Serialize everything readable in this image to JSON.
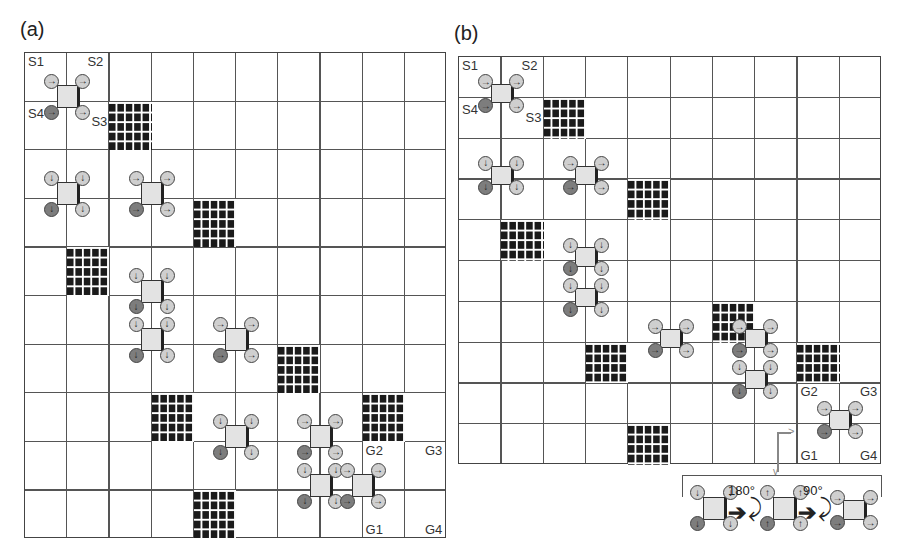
{
  "figure": {
    "panels": [
      {
        "id": "a",
        "label": "(a)",
        "grid": {
          "cols": 10,
          "rows": 10,
          "x": 24,
          "y": 52,
          "cell_w": 42.2,
          "cell_h": 48.6
        },
        "corner_labels": [
          {
            "text": "S1",
            "col": 0,
            "row": 0,
            "pos": "tl"
          },
          {
            "text": "S2",
            "col": 1,
            "row": 0,
            "pos": "tr"
          },
          {
            "text": "S4",
            "col": 0,
            "row": 1,
            "pos": "l"
          },
          {
            "text": "S3",
            "col": 1,
            "row": 1,
            "pos": "r"
          },
          {
            "text": "G2",
            "col": 8,
            "row": 8,
            "pos": "tl"
          },
          {
            "text": "G3",
            "col": 9,
            "row": 8,
            "pos": "tr"
          },
          {
            "text": "G1",
            "col": 8,
            "row": 9,
            "pos": "bl"
          },
          {
            "text": "G4",
            "col": 9,
            "row": 9,
            "pos": "br"
          }
        ],
        "obstacles": [
          [
            2,
            1
          ],
          [
            4,
            3
          ],
          [
            1,
            4
          ],
          [
            6,
            6
          ],
          [
            3,
            7
          ],
          [
            8,
            7
          ],
          [
            4,
            9
          ]
        ],
        "robots": [
          {
            "col": 1,
            "row": 1,
            "dir": "→"
          },
          {
            "col": 1,
            "row": 3,
            "dir": "↓"
          },
          {
            "col": 3,
            "row": 3,
            "dir": "→"
          },
          {
            "col": 3,
            "row": 5,
            "dir": "↓"
          },
          {
            "col": 3,
            "row": 6,
            "dir": "↓"
          },
          {
            "col": 5,
            "row": 6,
            "dir": "→"
          },
          {
            "col": 5,
            "row": 8,
            "dir": "↓"
          },
          {
            "col": 7,
            "row": 8,
            "dir": "→"
          },
          {
            "col": 7,
            "row": 9,
            "dir": "↓"
          },
          {
            "col": 8,
            "row": 9,
            "dir": "→"
          }
        ]
      },
      {
        "id": "b",
        "label": "(b)",
        "grid": {
          "cols": 10,
          "rows": 10,
          "x": 458,
          "y": 56,
          "cell_w": 42.3,
          "cell_h": 40.8
        },
        "corner_labels": [
          {
            "text": "S1",
            "col": 0,
            "row": 0,
            "pos": "tl"
          },
          {
            "text": "S2",
            "col": 1,
            "row": 0,
            "pos": "tr"
          },
          {
            "text": "S4",
            "col": 0,
            "row": 1,
            "pos": "l"
          },
          {
            "text": "S3",
            "col": 1,
            "row": 1,
            "pos": "r"
          },
          {
            "text": "G2",
            "col": 8,
            "row": 8,
            "pos": "tl"
          },
          {
            "text": "G3",
            "col": 9,
            "row": 8,
            "pos": "tr"
          },
          {
            "text": "G1",
            "col": 8,
            "row": 9,
            "pos": "bl"
          },
          {
            "text": "G4",
            "col": 9,
            "row": 9,
            "pos": "br"
          }
        ],
        "obstacles": [
          [
            2,
            1
          ],
          [
            4,
            3
          ],
          [
            1,
            4
          ],
          [
            6,
            6
          ],
          [
            3,
            7
          ],
          [
            8,
            7
          ],
          [
            4,
            9
          ]
        ],
        "robots": [
          {
            "col": 1,
            "row": 1,
            "dir": "→"
          },
          {
            "col": 1,
            "row": 3,
            "dir": "↓"
          },
          {
            "col": 3,
            "row": 3,
            "dir": "→"
          },
          {
            "col": 3,
            "row": 5,
            "dir": "↓"
          },
          {
            "col": 3,
            "row": 6,
            "dir": "↓"
          },
          {
            "col": 5,
            "row": 7,
            "dir": "→"
          },
          {
            "col": 7,
            "row": 7,
            "dir": "→"
          },
          {
            "col": 7,
            "row": 8,
            "dir": "↓"
          },
          {
            "col": 9,
            "row": 9,
            "dir": "→"
          }
        ]
      }
    ],
    "inset": {
      "rotation_1": "180°",
      "rotation_2": "90°",
      "stages": [
        {
          "dir": "↓"
        },
        {
          "dir": "↑"
        },
        {
          "dir": "→"
        }
      ]
    }
  }
}
